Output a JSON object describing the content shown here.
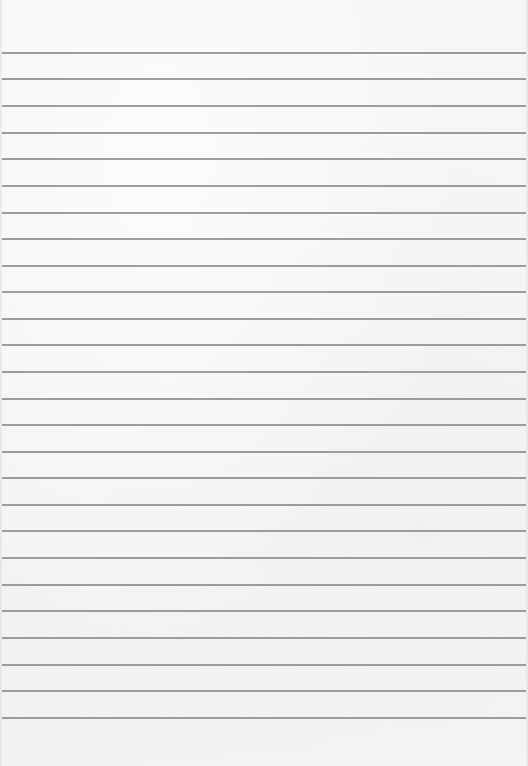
{
  "paper": {
    "type": "lined-paper",
    "background_color": "#f6f6f5",
    "rule_color": "#8c8c8c",
    "rule_count": 26,
    "rule_positions_y": [
      52,
      78,
      105,
      132,
      158,
      185,
      212,
      238,
      265,
      291,
      318,
      344,
      371,
      398,
      424,
      451,
      477,
      504,
      530,
      557,
      584,
      610,
      637,
      664,
      690,
      717
    ]
  }
}
